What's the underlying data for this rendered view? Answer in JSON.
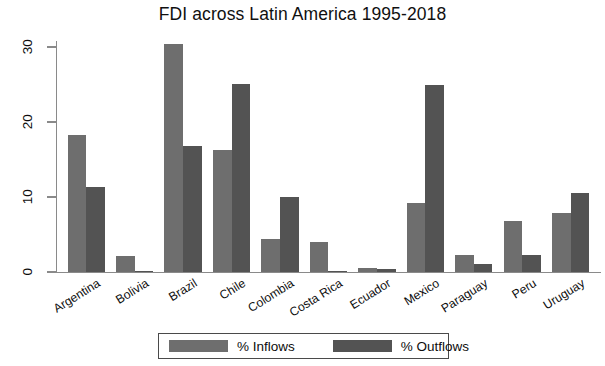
{
  "chart_data": {
    "type": "bar",
    "title": "FDI across Latin America 1995-2018",
    "xlabel": "",
    "ylabel": "",
    "ylim": [
      0,
      32
    ],
    "yticks": [
      0,
      10,
      20,
      30
    ],
    "ytick_labels": [
      "0",
      "10",
      "20",
      "30"
    ],
    "grid": false,
    "legend_position": "bottom",
    "categories": [
      "Argentina",
      "Bolivia",
      "Brazil",
      "Chile",
      "Colombia",
      "Costa Rica",
      "Ecuador",
      "Mexico",
      "Paraguay",
      "Peru",
      "Uruguay"
    ],
    "series": [
      {
        "name": "% Inflows",
        "color": "#6e6e6e",
        "values": [
          18.3,
          2.2,
          30.4,
          16.3,
          4.4,
          4.0,
          0.6,
          9.2,
          2.3,
          6.8,
          7.9
        ]
      },
      {
        "name": "% Outflows",
        "color": "#535353",
        "values": [
          11.4,
          0.1,
          16.8,
          25.1,
          10.0,
          0.1,
          0.4,
          24.9,
          1.1,
          2.3,
          10.5
        ]
      }
    ]
  },
  "legend": {
    "entries": [
      {
        "label": "% Inflows"
      },
      {
        "label": "% Outflows"
      }
    ]
  }
}
